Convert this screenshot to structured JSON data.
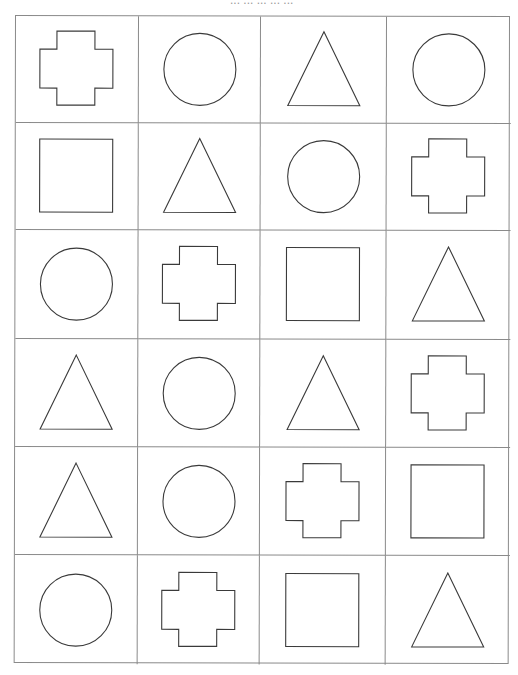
{
  "worksheet": {
    "header_text": "... ... ... ... ...",
    "grid": {
      "columns": 4,
      "rows": [
        [
          "cross",
          "circle",
          "triangle",
          "circle"
        ],
        [
          "square",
          "triangle",
          "circle",
          "cross"
        ],
        [
          "circle",
          "cross",
          "square",
          "triangle"
        ],
        [
          "triangle",
          "circle",
          "triangle",
          "cross"
        ],
        [
          "triangle",
          "circle",
          "cross",
          "square"
        ],
        [
          "circle",
          "cross",
          "square",
          "triangle"
        ]
      ]
    },
    "colors": {
      "grid_line": "#8a8a8a",
      "shape_stroke": "#3a3a3a",
      "background": "#ffffff"
    }
  }
}
